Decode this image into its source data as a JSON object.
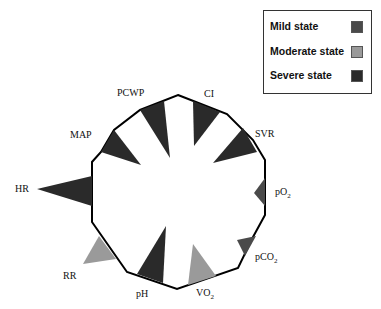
{
  "legend": {
    "items": [
      {
        "label": "Mild state",
        "color": "#4a4a4a"
      },
      {
        "label": "Moderate state",
        "color": "#9a9a9a"
      },
      {
        "label": "Severe state",
        "color": "#2a2a2a"
      }
    ]
  },
  "diagram": {
    "type": "radial-polygon-severity-chart",
    "outline_color": "#000000",
    "parameters": [
      {
        "label": "PCWP",
        "state": "Severe state"
      },
      {
        "label": "CI",
        "state": "Severe state"
      },
      {
        "label": "SVR",
        "state": "Severe state"
      },
      {
        "label": "pO2",
        "display": "pO₂",
        "state": "Mild state"
      },
      {
        "label": "pCO2",
        "display": "pCO₂",
        "state": "Mild state"
      },
      {
        "label": "VO2",
        "display": "VO₂",
        "state": "Moderate state"
      },
      {
        "label": "pH",
        "state": "Severe state"
      },
      {
        "label": "RR",
        "state": "Moderate state"
      },
      {
        "label": "HR",
        "state": "Severe state"
      },
      {
        "label": "MAP",
        "state": "Severe state"
      }
    ],
    "labels": {
      "pcwp": "PCWP",
      "ci": "CI",
      "svr": "SVR",
      "po2_main": "pO",
      "po2_sub": "2",
      "pco2_main": "pCO",
      "pco2_sub": "2",
      "vo2_main": "VO",
      "vo2_sub": "2",
      "ph": "pH",
      "rr": "RR",
      "hr": "HR",
      "map": "MAP"
    }
  }
}
